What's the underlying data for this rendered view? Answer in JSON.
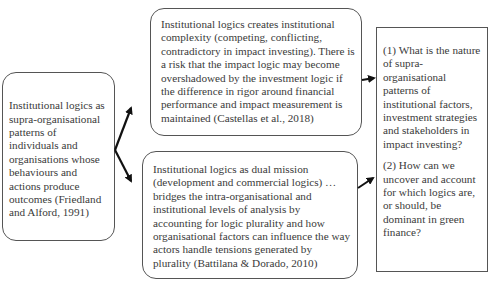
{
  "diagram": {
    "left_box": {
      "text": "Institutional logics as supra-organisational patterns of individuals and organisations whose behaviours and actions produce outcomes (Friedland and Alford, 1991)"
    },
    "top_middle_box": {
      "text": "Institutional logics creates institutional complexity (competing, conflicting, contradictory in impact investing). There is a risk that the impact logic may become overshadowed by the investment logic if the difference in rigor around financial performance and impact measurement is maintained (Castellas et al., 2018)"
    },
    "bottom_middle_box": {
      "text": "Institutional logics as dual mission (development and commercial logics) …bridges the intra-organisational and institutional levels of analysis by accounting for logic plurality and how organisational factors can influence the way actors handle tensions generated by plurality (Battilana & Dorado, 2010)"
    },
    "right_box": {
      "questions": [
        "(1) What is the nature of supra-organisational patterns of institutional factors, investment strategies and stakeholders in impact investing?",
        "(2) How can we uncover and account for which logics are, or should, be dominant in green finance?"
      ]
    },
    "arrows": [
      {
        "from": "left_box",
        "to": "top_middle_box"
      },
      {
        "from": "left_box",
        "to": "bottom_middle_box"
      },
      {
        "from": "top_middle_box",
        "to": "right_box"
      },
      {
        "from": "bottom_middle_box",
        "to": "right_box"
      }
    ],
    "colors": {
      "border": "#555555",
      "text": "#3a3a3a",
      "arrow": "#111111"
    }
  }
}
